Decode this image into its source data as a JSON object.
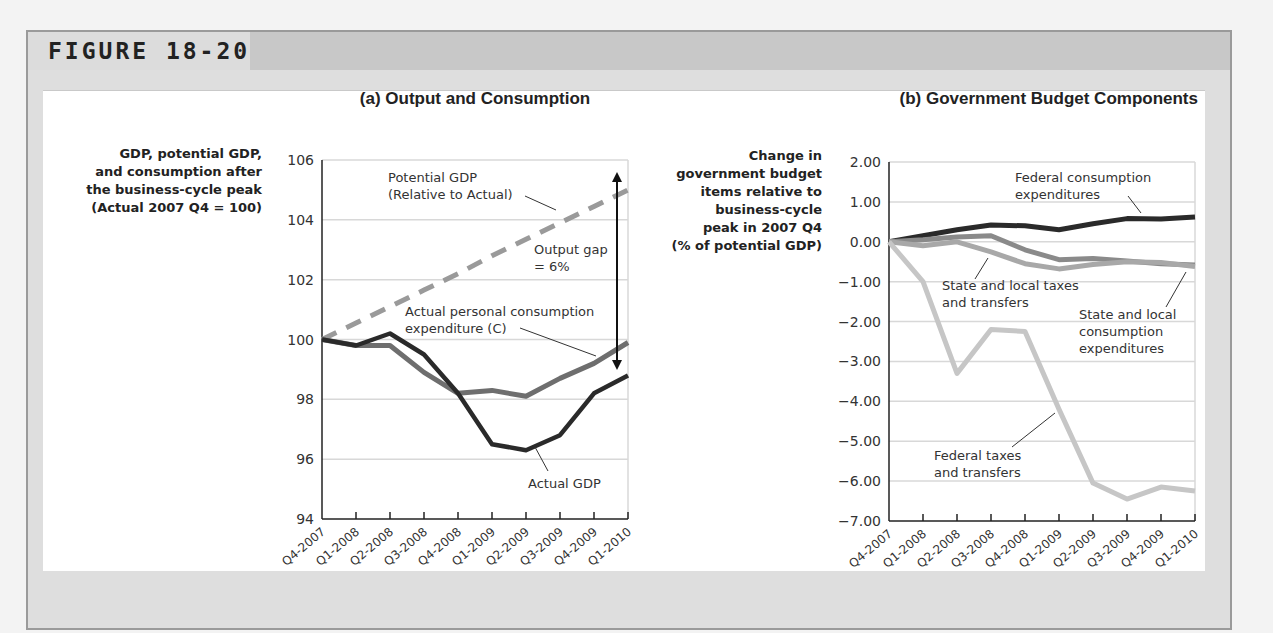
{
  "figure": {
    "label": "FIGURE 18-20"
  },
  "colors": {
    "frame_bg": "#dedede",
    "header_dark": "#c8c8c8",
    "panel_bg": "#ffffff",
    "gridline": "#d8d8d8",
    "actual_gdp": "#2a2a2a",
    "consumption": "#6e6e6e",
    "potential_gdp": "#9a9a9a",
    "federal_consumption": "#2a2a2a",
    "state_local_consumption": "#8a8a8a",
    "state_local_taxes": "#a8a8a8",
    "federal_taxes": "#c6c6c6"
  },
  "chart_data": [
    {
      "type": "line",
      "title": "(a) Output and Consumption",
      "ylabel_lines": [
        "GDP, potential GDP,",
        "and consumption after",
        "the business-cycle peak",
        "(Actual 2007 Q4 = 100)"
      ],
      "xlabel": "",
      "ylim": [
        94,
        106
      ],
      "yticks": [
        "106",
        "104",
        "102",
        "100",
        "98",
        "96",
        "94"
      ],
      "grid": true,
      "categories": [
        "Q4-2007",
        "Q1-2008",
        "Q2-2008",
        "Q3-2008",
        "Q4-2008",
        "Q1-2009",
        "Q2-2009",
        "Q3-2009",
        "Q4-2009",
        "Q1-2010"
      ],
      "series": [
        {
          "name": "Potential GDP (Relative to Actual)",
          "style": "dashed",
          "values": [
            100,
            100.55,
            101.1,
            101.65,
            102.2,
            102.8,
            103.35,
            103.9,
            104.45,
            105.0
          ]
        },
        {
          "name": "Actual personal consumption expenditure (C)",
          "style": "solid",
          "values": [
            100,
            99.8,
            99.8,
            98.9,
            98.2,
            98.3,
            98.1,
            98.7,
            99.2,
            99.9
          ]
        },
        {
          "name": "Actual GDP",
          "style": "solid",
          "values": [
            100,
            99.8,
            100.2,
            99.5,
            98.2,
            96.5,
            96.3,
            96.8,
            98.2,
            98.8
          ]
        }
      ],
      "annotations": {
        "potential_line1": "Potential GDP",
        "potential_line2": "(Relative to Actual)",
        "gap_line1": "Output gap",
        "gap_line2": "= 6%",
        "consumption_line1": "Actual personal consumption",
        "consumption_line2": "expenditure (C)",
        "gdp": "Actual GDP"
      }
    },
    {
      "type": "line",
      "title": "(b) Government Budget Components",
      "ylabel_lines": [
        "Change in",
        "government budget",
        "items relative to",
        "business-cycle",
        "peak in 2007 Q4",
        "(% of potential GDP)"
      ],
      "xlabel": "",
      "ylim": [
        -7.0,
        2.0
      ],
      "yticks": [
        "2.00",
        "1.00",
        "0.00",
        "−1.00",
        "−2.00",
        "−3.00",
        "−4.00",
        "−5.00",
        "−6.00",
        "−7.00"
      ],
      "grid": true,
      "categories": [
        "Q4-2007",
        "Q1-2008",
        "Q2-2008",
        "Q3-2008",
        "Q4-2008",
        "Q1-2009",
        "Q2-2009",
        "Q3-2009",
        "Q4-2009",
        "Q1-2010"
      ],
      "series": [
        {
          "name": "Federal consumption expenditures",
          "values": [
            0,
            0.15,
            0.3,
            0.42,
            0.4,
            0.3,
            0.45,
            0.58,
            0.57,
            0.62
          ]
        },
        {
          "name": "State and local consumption expenditures",
          "values": [
            0,
            0.05,
            0.12,
            0.15,
            -0.2,
            -0.45,
            -0.42,
            -0.48,
            -0.55,
            -0.58
          ]
        },
        {
          "name": "State and local taxes and transfers",
          "values": [
            0,
            -0.1,
            0.0,
            -0.25,
            -0.55,
            -0.68,
            -0.57,
            -0.5,
            -0.52,
            -0.62
          ]
        },
        {
          "name": "Federal taxes and transfers",
          "values": [
            0,
            -1.0,
            -3.3,
            -2.2,
            -2.25,
            -4.2,
            -6.05,
            -6.45,
            -6.15,
            -6.25
          ]
        }
      ],
      "annotations": {
        "fed_cons_line1": "Federal consumption",
        "fed_cons_line2": "expenditures",
        "sl_tax_line1": "State and local taxes",
        "sl_tax_line2": "and transfers",
        "sl_cons_line1": "State and local",
        "sl_cons_line2": "consumption",
        "sl_cons_line3": "expenditures",
        "fed_tax_line1": "Federal taxes",
        "fed_tax_line2": "and transfers"
      }
    }
  ]
}
